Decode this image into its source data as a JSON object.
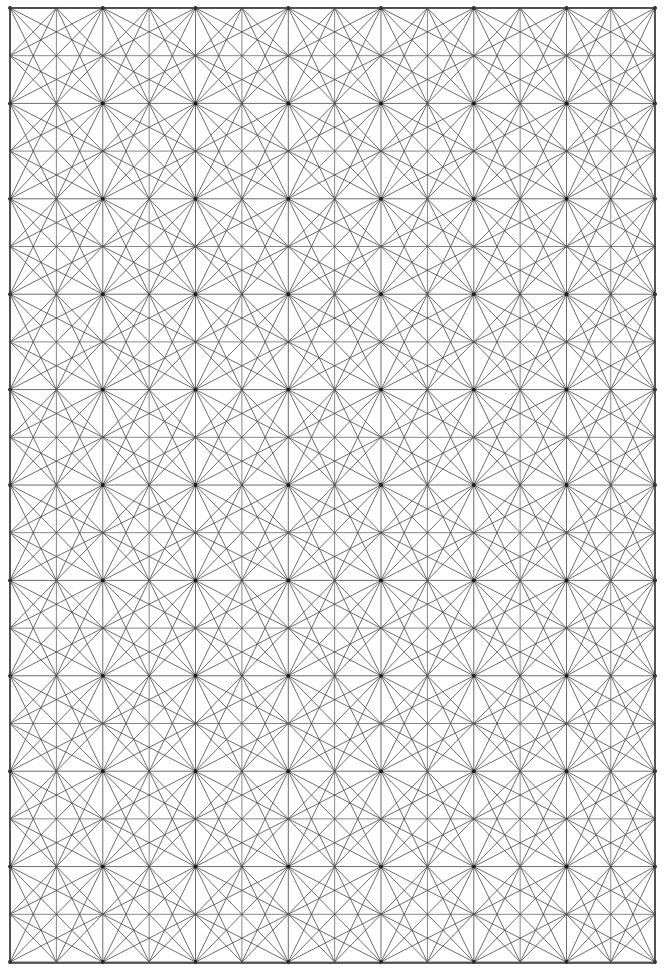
{
  "document": {
    "title": "Geometric Tessellation Pattern",
    "kind": "line-drawing",
    "width": 665,
    "height": 973,
    "background_color": "#ffffff"
  },
  "chart_data": {
    "type": "diagram",
    "title": "",
    "subtitle": "",
    "xlabel": "",
    "ylabel": "",
    "grid": {
      "on": true,
      "border": {
        "x0": 10,
        "y0": 8,
        "x1": 655,
        "y1": 963
      },
      "major_columns_x": [
        10,
        102.8,
        195.5,
        288.3,
        381.0,
        473.8,
        566.5,
        655
      ],
      "major_rows_y": [
        8,
        103.4,
        198.8,
        294.2,
        389.6,
        485.0,
        580.4,
        675.8,
        771.2,
        866.6,
        962
      ],
      "major_col_spacing": 92.7,
      "major_row_spacing": 95.4,
      "subdivisions_per_cell": 2,
      "major_columns_count": 7,
      "major_rows_count": 11
    },
    "style": {
      "line_color": "#464646",
      "border_color": "#3a3a3a",
      "sub_grid_color": "#6a6a6a",
      "diagonal_color": "#4a4a4a",
      "line_width": 0.8,
      "border_width": 1.6,
      "hub_radius": 1.9,
      "hub_color": "#1c1c1c"
    },
    "motif": {
      "name": "pinwheel-triangulated-cell",
      "notes": "Each major cell is split into a 2x2 sub-grid. Diagonals run corner-to-corner and corner-to-sub-node in a rotationally repeating arrangement, so that at every major grid corner roughly twelve line ends converge into a dark hub.",
      "sub_nodes_per_cell": 9,
      "hub_spoke_count": 12
    },
    "legend": {
      "entries": [],
      "position": "none"
    },
    "annotations": []
  }
}
